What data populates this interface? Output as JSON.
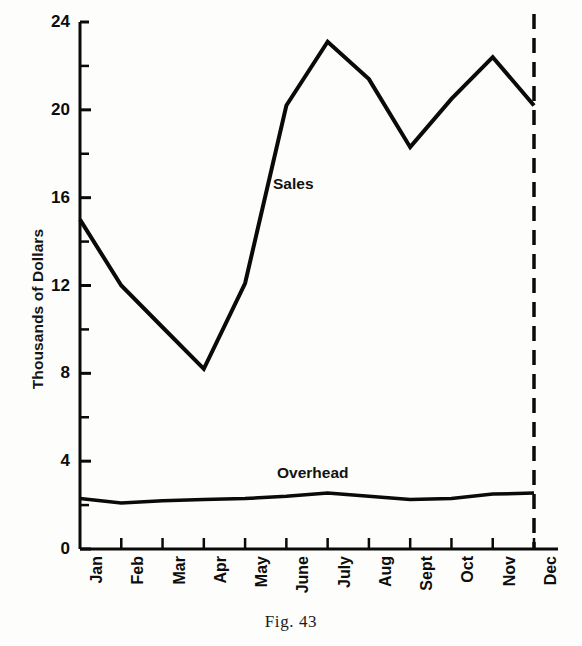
{
  "figure": {
    "caption": "Fig. 43"
  },
  "chart_data": {
    "type": "line",
    "title": "",
    "xlabel": "",
    "ylabel": "Thousands of Dollars",
    "categories": [
      "Jan",
      "Feb",
      "Mar",
      "Apr",
      "May",
      "June",
      "July",
      "Aug",
      "Sept",
      "Oct",
      "Nov",
      "Dec"
    ],
    "series": [
      {
        "name": "Sales",
        "values": [
          15.0,
          12.0,
          10.1,
          8.2,
          12.1,
          20.2,
          23.1,
          21.4,
          18.3,
          20.5,
          22.4,
          20.2
        ]
      },
      {
        "name": "Overhead",
        "values": [
          2.3,
          2.1,
          2.2,
          2.25,
          2.3,
          2.4,
          2.55,
          2.4,
          2.25,
          2.3,
          2.5,
          2.55
        ]
      }
    ],
    "ylim": [
      0,
      24
    ],
    "y_major_ticks": [
      0,
      4,
      8,
      12,
      16,
      20,
      24
    ],
    "y_minor_ticks": [
      2,
      6,
      10,
      14,
      18,
      22
    ],
    "y_tick_labels": [
      "0",
      "4",
      "8",
      "12",
      "16",
      "20",
      "24"
    ],
    "grid": false,
    "legend_position": "inline-annotation",
    "annotations": [
      {
        "text": "Sales",
        "series": "Sales"
      },
      {
        "text": "Overhead",
        "series": "Overhead"
      }
    ],
    "vertical_marker": {
      "at_category": "Dec",
      "style": "dashed"
    },
    "line_color": "#0a0a0a",
    "background_color": "#fdfdfb"
  }
}
